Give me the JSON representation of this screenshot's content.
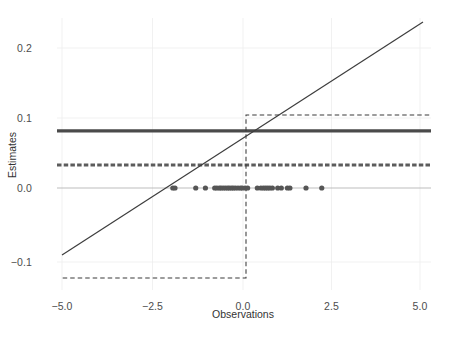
{
  "chart_data": {
    "type": "line",
    "title": "",
    "xlabel": "Observations",
    "ylabel": "Estimates",
    "xlim": [
      -5.45,
      5.25
    ],
    "ylim": [
      -0.148,
      0.243
    ],
    "xticks": [
      -5.0,
      -2.5,
      0.0,
      2.5,
      5.0
    ],
    "xtick_labels": [
      "−5.0",
      "−2.5",
      "0.0",
      "2.5",
      "5.0"
    ],
    "yticks": [
      0.2,
      0.1,
      0.0,
      -0.1
    ],
    "ytick_labels": [
      "0.2",
      "0.1",
      "0.0",
      "−0.1"
    ],
    "grid": true,
    "legend": "none",
    "series": [
      {
        "name": "linear-estimate",
        "style": "solid-thin",
        "color": "#404040",
        "width": 1.1,
        "x": [
          -5.0,
          5.05
        ],
        "y": [
          -0.0937,
          0.2327
        ]
      },
      {
        "name": "constant-estimate",
        "style": "solid-thick",
        "color": "#4a4a4a",
        "width": 3.2,
        "x": [
          -5.45,
          5.25
        ],
        "y": [
          0.08,
          0.08
        ]
      },
      {
        "name": "constant-estimate-dashed",
        "style": "dashed-thick",
        "color": "#5a5a5a",
        "width": 3.0,
        "dash": "4,2",
        "x": [
          -5.45,
          5.25
        ],
        "y": [
          0.0323,
          0.0323
        ]
      },
      {
        "name": "step-estimate",
        "style": "dashed-thin",
        "color": "#3a3a3a",
        "width": 1.1,
        "dash": "4,3",
        "x": [
          -4.98,
          0.085,
          0.085,
          5.22
        ],
        "y": [
          -0.1263,
          -0.1263,
          0.1024,
          0.1024
        ]
      },
      {
        "name": "zero-reference-line",
        "style": "solid-thin",
        "color": "#b0b0b0",
        "width": 0.9,
        "x": [
          -5.45,
          5.25
        ],
        "y": [
          0.0,
          0.0
        ]
      }
    ],
    "scatter": {
      "name": "observations-rug",
      "color": "#555555",
      "radius": 2.6,
      "y": 0.0,
      "x": [
        -1.96,
        -1.9,
        -1.32,
        -1.05,
        -0.79,
        -0.73,
        -0.66,
        -0.61,
        -0.55,
        -0.49,
        -0.43,
        -0.38,
        -0.32,
        -0.27,
        -0.21,
        -0.14,
        -0.07,
        -0.02,
        0.06,
        0.13,
        0.4,
        0.5,
        0.57,
        0.63,
        0.69,
        0.75,
        0.82,
        0.97,
        1.07,
        1.24,
        1.31,
        1.76,
        2.2
      ]
    }
  },
  "axes": {
    "x_title": "Observations",
    "y_title": "Estimates"
  }
}
